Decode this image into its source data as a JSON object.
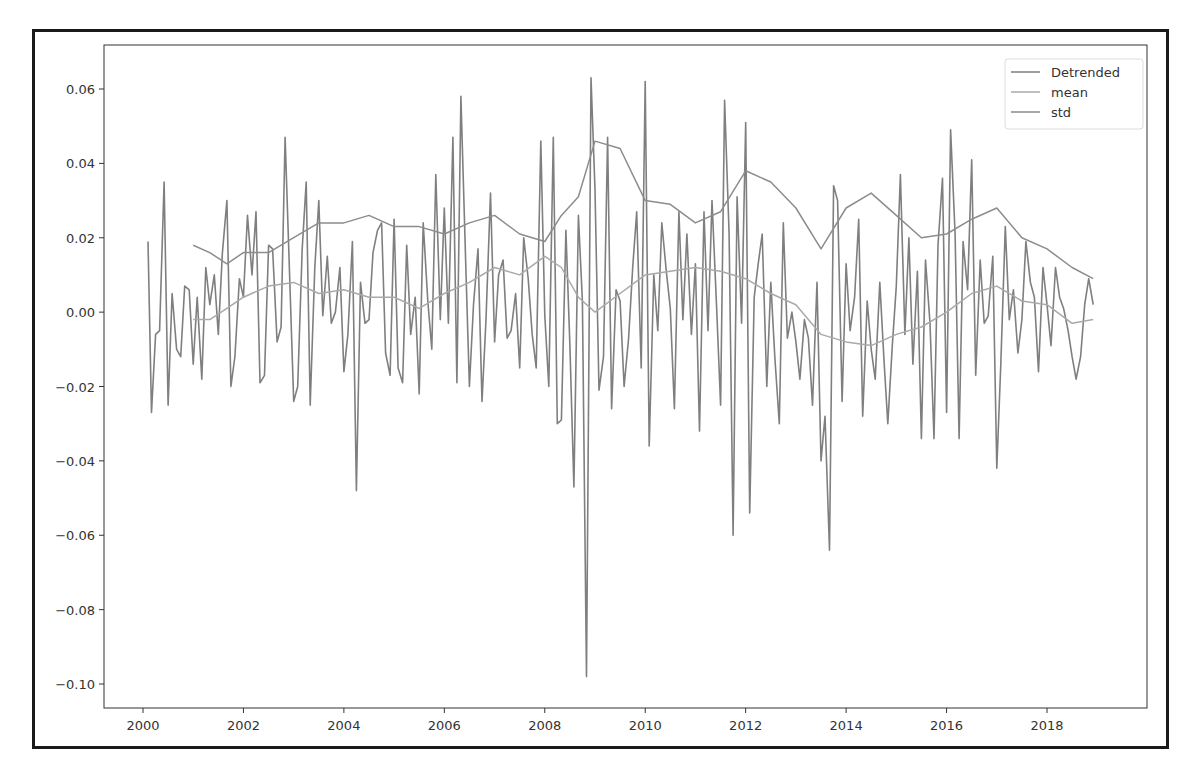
{
  "chart_data": {
    "type": "line",
    "title": "",
    "xlabel": "",
    "ylabel": "",
    "xlim": [
      1999.75,
      2019.6
    ],
    "ylim": [
      -0.106,
      0.0722
    ],
    "grid": false,
    "legend": {
      "position": "upper right",
      "entries": [
        "Detrended",
        "mean",
        "std"
      ]
    },
    "x_ticks": [
      "2000",
      "2002",
      "2004",
      "2006",
      "2008",
      "2010",
      "2012",
      "2014",
      "2016",
      "2018"
    ],
    "y_ticks": [
      "0.06",
      "0.04",
      "0.02",
      "0.00",
      "-0.02",
      "-0.04",
      "-0.06",
      "-0.08",
      "-0.10"
    ],
    "series": [
      {
        "name": "Detrended",
        "color": "#7f7f7f",
        "x": [
          2000.1,
          2000.17,
          2000.25,
          2000.33,
          2000.42,
          2000.5,
          2000.58,
          2000.67,
          2000.75,
          2000.83,
          2000.92,
          2001.0,
          2001.08,
          2001.17,
          2001.25,
          2001.33,
          2001.42,
          2001.5,
          2001.58,
          2001.67,
          2001.75,
          2001.83,
          2001.92,
          2002.0,
          2002.08,
          2002.17,
          2002.25,
          2002.33,
          2002.42,
          2002.5,
          2002.58,
          2002.67,
          2002.75,
          2002.83,
          2002.92,
          2003.0,
          2003.08,
          2003.17,
          2003.25,
          2003.33,
          2003.42,
          2003.5,
          2003.58,
          2003.67,
          2003.75,
          2003.83,
          2003.92,
          2004.0,
          2004.08,
          2004.17,
          2004.25,
          2004.33,
          2004.42,
          2004.5,
          2004.58,
          2004.67,
          2004.75,
          2004.83,
          2004.92,
          2005.0,
          2005.08,
          2005.17,
          2005.25,
          2005.33,
          2005.42,
          2005.5,
          2005.58,
          2005.67,
          2005.75,
          2005.83,
          2005.92,
          2006.0,
          2006.08,
          2006.17,
          2006.25,
          2006.33,
          2006.42,
          2006.5,
          2006.58,
          2006.67,
          2006.75,
          2006.83,
          2006.92,
          2007.0,
          2007.08,
          2007.17,
          2007.25,
          2007.33,
          2007.42,
          2007.5,
          2007.58,
          2007.67,
          2007.75,
          2007.83,
          2007.92,
          2008.0,
          2008.08,
          2008.17,
          2008.25,
          2008.33,
          2008.42,
          2008.5,
          2008.58,
          2008.67,
          2008.75,
          2008.83,
          2008.92,
          2009.0,
          2009.08,
          2009.17,
          2009.25,
          2009.33,
          2009.42,
          2009.5,
          2009.58,
          2009.67,
          2009.75,
          2009.83,
          2009.92,
          2010.0,
          2010.08,
          2010.17,
          2010.25,
          2010.33,
          2010.42,
          2010.5,
          2010.58,
          2010.67,
          2010.75,
          2010.83,
          2010.92,
          2011.0,
          2011.08,
          2011.17,
          2011.25,
          2011.33,
          2011.42,
          2011.5,
          2011.58,
          2011.67,
          2011.75,
          2011.83,
          2011.92,
          2012.0,
          2012.08,
          2012.17,
          2012.25,
          2012.33,
          2012.42,
          2012.5,
          2012.58,
          2012.67,
          2012.75,
          2012.83,
          2012.92,
          2013.0,
          2013.08,
          2013.17,
          2013.25,
          2013.33,
          2013.42,
          2013.5,
          2013.58,
          2013.67,
          2013.75,
          2013.83,
          2013.92,
          2014.0,
          2014.08,
          2014.17,
          2014.25,
          2014.33,
          2014.42,
          2014.5,
          2014.58,
          2014.67,
          2014.75,
          2014.83,
          2014.92,
          2015.0,
          2015.08,
          2015.17,
          2015.25,
          2015.33,
          2015.42,
          2015.5,
          2015.58,
          2015.67,
          2015.75,
          2015.83,
          2015.92,
          2016.0,
          2016.08,
          2016.17,
          2016.25,
          2016.33,
          2016.42,
          2016.5,
          2016.58,
          2016.67,
          2016.75,
          2016.83,
          2016.92,
          2017.0,
          2017.08,
          2017.17,
          2017.25,
          2017.33,
          2017.42,
          2017.5,
          2017.58,
          2017.67,
          2017.75,
          2017.83,
          2017.92,
          2018.0,
          2018.08,
          2018.17,
          2018.25,
          2018.33,
          2018.42,
          2018.5,
          2018.58,
          2018.67,
          2018.75,
          2018.83,
          2018.92
        ],
        "values": [
          0.019,
          -0.027,
          -0.006,
          -0.005,
          0.035,
          -0.025,
          0.005,
          -0.01,
          -0.012,
          0.007,
          0.006,
          -0.014,
          0.004,
          -0.018,
          0.012,
          0.002,
          0.01,
          -0.006,
          0.016,
          0.03,
          -0.02,
          -0.012,
          0.009,
          0.004,
          0.026,
          0.01,
          0.027,
          -0.019,
          -0.017,
          0.018,
          0.017,
          -0.008,
          -0.004,
          0.047,
          0.01,
          -0.024,
          -0.02,
          0.017,
          0.035,
          -0.025,
          0.012,
          0.03,
          -0.001,
          0.015,
          -0.003,
          0.0,
          0.012,
          -0.016,
          -0.006,
          0.019,
          -0.048,
          0.008,
          -0.003,
          -0.002,
          0.016,
          0.022,
          0.024,
          -0.011,
          -0.017,
          0.025,
          -0.015,
          -0.019,
          0.018,
          -0.006,
          0.004,
          -0.022,
          0.024,
          0.003,
          -0.01,
          0.037,
          -0.002,
          0.028,
          -0.003,
          0.047,
          -0.019,
          0.058,
          0.016,
          -0.02,
          0.002,
          0.017,
          -0.024,
          -0.002,
          0.032,
          -0.008,
          0.01,
          0.014,
          -0.007,
          -0.005,
          0.005,
          -0.015,
          0.02,
          0.009,
          -0.006,
          -0.015,
          0.046,
          -0.001,
          -0.02,
          0.047,
          -0.03,
          -0.029,
          0.022,
          -0.009,
          -0.047,
          0.026,
          0.003,
          -0.098,
          0.063,
          0.033,
          -0.021,
          -0.012,
          0.047,
          -0.026,
          0.006,
          0.003,
          -0.02,
          -0.007,
          0.012,
          0.027,
          -0.015,
          0.062,
          -0.036,
          0.01,
          -0.005,
          0.024,
          0.011,
          0.001,
          -0.026,
          0.027,
          -0.002,
          0.021,
          -0.006,
          0.013,
          -0.032,
          0.027,
          -0.005,
          0.03,
          0.002,
          -0.025,
          0.057,
          0.021,
          -0.06,
          0.031,
          -0.003,
          0.051,
          -0.054,
          0.004,
          0.013,
          0.021,
          -0.02,
          0.008,
          -0.012,
          -0.03,
          0.024,
          -0.007,
          0.0,
          -0.008,
          -0.018,
          -0.002,
          -0.007,
          -0.025,
          0.008,
          -0.04,
          -0.028,
          -0.064,
          0.034,
          0.03,
          -0.024,
          0.013,
          -0.005,
          0.004,
          0.025,
          -0.028,
          0.003,
          -0.01,
          -0.018,
          0.008,
          -0.012,
          -0.03,
          -0.009,
          0.007,
          0.037,
          -0.006,
          0.02,
          -0.014,
          0.011,
          -0.034,
          0.014,
          -0.003,
          -0.034,
          0.018,
          0.036,
          -0.027,
          0.049,
          0.021,
          -0.034,
          0.019,
          0.006,
          0.041,
          -0.017,
          0.014,
          -0.003,
          -0.001,
          0.015,
          -0.042,
          -0.014,
          0.023,
          -0.002,
          0.006,
          -0.011,
          -0.002,
          0.019,
          0.008,
          0.004,
          -0.016,
          0.012,
          0.002,
          -0.009,
          0.012,
          0.004,
          0.001,
          -0.005,
          -0.012,
          -0.018,
          -0.012,
          0.002,
          0.009,
          0.002
        ]
      },
      {
        "name": "mean",
        "color": "#a9a9a9",
        "x": [
          2001.0,
          2001.33,
          2001.67,
          2002.0,
          2002.5,
          2003.0,
          2003.5,
          2004.0,
          2004.5,
          2005.0,
          2005.5,
          2006.0,
          2006.5,
          2007.0,
          2007.5,
          2008.0,
          2008.33,
          2008.67,
          2009.0,
          2009.5,
          2010.0,
          2010.5,
          2011.0,
          2011.5,
          2012.0,
          2012.5,
          2013.0,
          2013.5,
          2014.0,
          2014.5,
          2015.0,
          2015.5,
          2016.0,
          2016.5,
          2017.0,
          2017.5,
          2018.0,
          2018.5,
          2018.92
        ],
        "values": [
          -0.002,
          -0.002,
          0.001,
          0.004,
          0.007,
          0.008,
          0.005,
          0.006,
          0.004,
          0.004,
          0.001,
          0.005,
          0.008,
          0.012,
          0.01,
          0.015,
          0.012,
          0.004,
          0.0,
          0.005,
          0.01,
          0.011,
          0.012,
          0.011,
          0.009,
          0.005,
          0.002,
          -0.006,
          -0.008,
          -0.009,
          -0.006,
          -0.004,
          0.0,
          0.005,
          0.007,
          0.003,
          0.002,
          -0.003,
          -0.002
        ]
      },
      {
        "name": "std",
        "color": "#8c8c8c",
        "x": [
          2001.0,
          2001.33,
          2001.67,
          2002.0,
          2002.5,
          2003.0,
          2003.5,
          2004.0,
          2004.5,
          2005.0,
          2005.5,
          2006.0,
          2006.5,
          2007.0,
          2007.5,
          2008.0,
          2008.33,
          2008.67,
          2009.0,
          2009.5,
          2010.0,
          2010.5,
          2011.0,
          2011.5,
          2012.0,
          2012.5,
          2013.0,
          2013.5,
          2014.0,
          2014.5,
          2015.0,
          2015.5,
          2016.0,
          2016.5,
          2017.0,
          2017.5,
          2018.0,
          2018.5,
          2018.92
        ],
        "values": [
          0.018,
          0.016,
          0.013,
          0.016,
          0.016,
          0.02,
          0.024,
          0.024,
          0.026,
          0.023,
          0.023,
          0.021,
          0.024,
          0.026,
          0.021,
          0.019,
          0.026,
          0.031,
          0.046,
          0.044,
          0.03,
          0.029,
          0.024,
          0.027,
          0.038,
          0.035,
          0.028,
          0.017,
          0.028,
          0.032,
          0.026,
          0.02,
          0.021,
          0.025,
          0.028,
          0.02,
          0.017,
          0.012,
          0.009
        ]
      }
    ]
  }
}
